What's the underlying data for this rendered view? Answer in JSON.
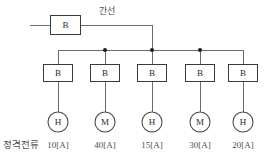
{
  "diagram": {
    "type": "single-line-electrical-diagram",
    "main_breaker": {
      "symbol": "B",
      "name": "main-breaker"
    },
    "feeder_label": "간선",
    "rated_current_label": "정격전류",
    "colors": {
      "line": "#6b6b6b",
      "box_stroke": "#3a3a3a",
      "circle_stroke": "#4a4a4a",
      "dot": "#1d1d1d",
      "text": "#4d4d4d",
      "background": "#ffffff"
    },
    "branches": [
      {
        "breaker": "B",
        "load": "H",
        "rated_current": "10[A]"
      },
      {
        "breaker": "B",
        "load": "M",
        "rated_current": "40[A]"
      },
      {
        "breaker": "B",
        "load": "H",
        "rated_current": "15[A]"
      },
      {
        "breaker": "B",
        "load": "M",
        "rated_current": "30[A]"
      },
      {
        "breaker": "B",
        "load": "H",
        "rated_current": "20[A]"
      }
    ]
  }
}
